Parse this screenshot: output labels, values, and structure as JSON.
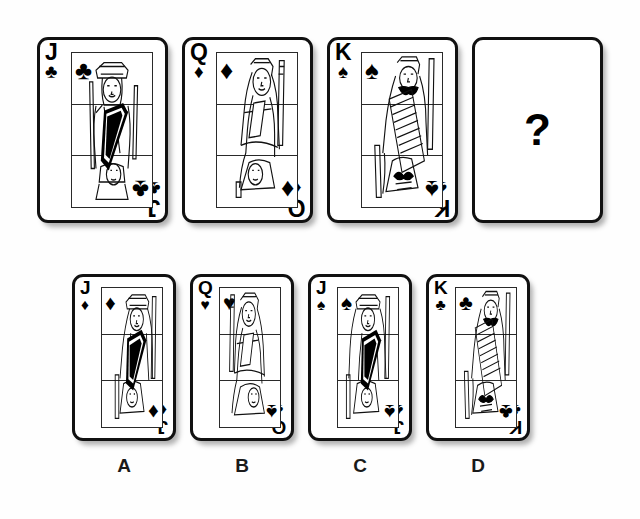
{
  "puzzle": {
    "type": "visual-sequence-completion",
    "question_symbol": "?",
    "sequence_label": "card sequence row",
    "options_label": "answer options row"
  },
  "suits": {
    "clubs": "♣",
    "diamonds": "♦",
    "hearts": "♥",
    "spades": "♠"
  },
  "sequence": [
    {
      "id": "seq-1",
      "name": "jack-of-clubs",
      "rank": "J",
      "suit": "clubs",
      "pip": "♣",
      "court": "jack",
      "is_question": false
    },
    {
      "id": "seq-2",
      "name": "queen-of-diamonds",
      "rank": "Q",
      "suit": "diamonds",
      "pip": "♦",
      "court": "queen",
      "is_question": false
    },
    {
      "id": "seq-3",
      "name": "king-of-spades",
      "rank": "K",
      "suit": "spades",
      "pip": "♠",
      "court": "king",
      "is_question": false
    },
    {
      "id": "seq-4",
      "name": "unknown-card",
      "rank": "",
      "suit": "",
      "pip": "",
      "court": "none",
      "is_question": true,
      "question_symbol": "?"
    }
  ],
  "options": [
    {
      "id": "opt-a",
      "label": "A",
      "name": "jack-of-diamonds",
      "rank": "J",
      "suit": "diamonds",
      "pip": "♦",
      "court": "jack"
    },
    {
      "id": "opt-b",
      "label": "B",
      "name": "queen-of-hearts",
      "rank": "Q",
      "suit": "hearts",
      "pip": "♥",
      "court": "queen",
      "bottom_pip": "♠"
    },
    {
      "id": "opt-c",
      "label": "C",
      "name": "jack-of-spades",
      "rank": "J",
      "suit": "spades",
      "pip": "♠",
      "court": "jack"
    },
    {
      "id": "opt-d",
      "label": "D",
      "name": "king-of-clubs",
      "rank": "K",
      "suit": "clubs",
      "pip": "♣",
      "court": "king"
    }
  ],
  "colors": {
    "ink": "#000000",
    "card_border": "#111111",
    "card_face": "#ffffff",
    "background": "#fefefe",
    "shadow": "rgba(60,60,60,0.40)"
  }
}
